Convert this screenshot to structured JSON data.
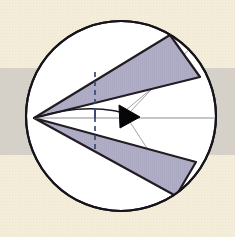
{
  "figure": {
    "caption": "",
    "width": 235,
    "height": 237
  },
  "canvas": {
    "background_color": "#f2ecd9",
    "paper_texture_color": "#ece4cd",
    "band": {
      "label": "horizontal gray band",
      "color": "#c9c6c0",
      "y_top": 68,
      "y_bottom": 155
    }
  },
  "circle": {
    "label": "bounding circle",
    "center_x": 121,
    "center_y": 116,
    "radius": 95,
    "fill_color": "#ffffff",
    "stroke_color": "#16131a",
    "stroke_width": 2.1
  },
  "apex": {
    "label": "apex vertex",
    "x": 34,
    "y": 118
  },
  "wedges": [
    {
      "name": "upper-wedge",
      "fill_color": "#b0aec6",
      "stroke_color": "#241c22",
      "stroke_width": 2.2,
      "points": "34,118 170,35 200,77"
    },
    {
      "name": "lower-wedge",
      "fill_color": "#b0aec6",
      "stroke_color": "#241c22",
      "stroke_width": 2.2,
      "points": "34,118 196,162 176,196"
    }
  ],
  "axis_line": {
    "label": "horizontal axis",
    "color": "#8e8c90",
    "stroke_width": 1.1,
    "x1": 34,
    "y1": 118,
    "x2": 214,
    "y2": 118
  },
  "dashed_line": {
    "label": "vertical dashed directrix",
    "color": "#3a4a72",
    "stroke_width": 1.7,
    "dash_pattern": "5,4",
    "x": 95,
    "y_top": 72,
    "y_bottom": 150
  },
  "arc_curve": {
    "label": "curved generator arc",
    "color": "#1b1820",
    "stroke_width": 1.5,
    "start_x": 34,
    "start_y": 118,
    "control_x": 92,
    "control_y": 100,
    "end_x": 137,
    "end_y": 117
  },
  "arrow_marker": {
    "label": "solid triangular arrowhead",
    "fill_color": "#080609",
    "points": "119,105 140,117 120,128"
  },
  "radial_lines": [
    {
      "name": "radial-upper",
      "color": "#a3a1a6",
      "stroke_width": 1.0,
      "x1": 130,
      "y1": 112,
      "x2": 196,
      "y2": 42
    },
    {
      "name": "radial-lower",
      "color": "#a3a1a6",
      "stroke_width": 1.0,
      "x1": 130,
      "y1": 122,
      "x2": 178,
      "y2": 196
    },
    {
      "name": "radial-chord",
      "color": "#a3a1a6",
      "stroke_width": 1.0,
      "x1": 126,
      "y1": 110,
      "x2": 186,
      "y2": 60
    }
  ],
  "tick_marks": [
    {
      "name": "tick-upper",
      "color": "#3a4a72",
      "x": 95,
      "y1": 108,
      "y2": 118
    },
    {
      "name": "tick-axis",
      "color": "#6a6870",
      "x": 95,
      "y1": 116,
      "y2": 120
    }
  ]
}
